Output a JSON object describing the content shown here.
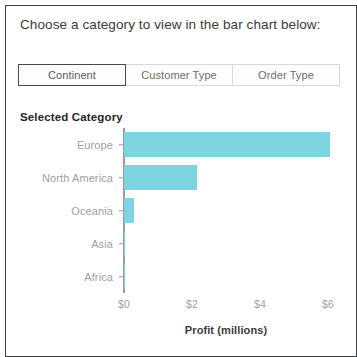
{
  "card": {
    "header_text": "Choose a category to view in the bar chart below:"
  },
  "slicer": {
    "name": "category-slicer",
    "selected": "Continent",
    "options": [
      {
        "label": "Continent",
        "selected": true
      },
      {
        "label": "Customer Type",
        "selected": false
      },
      {
        "label": "Order Type",
        "selected": false
      }
    ]
  },
  "colors": {
    "bar": "#7ED4E0",
    "axis": "#9A9A9A",
    "tick_label": "#A0A0A0",
    "title_text": "#262626",
    "card_border": "#3A3F44",
    "tab_border_selected": "#4A4A4A",
    "tab_border": "#D8D8D8"
  },
  "chart_data": {
    "type": "bar",
    "orientation": "horizontal",
    "title": "Selected Category",
    "categories": [
      "Europe",
      "North America",
      "Oceania",
      "Asia",
      "Africa"
    ],
    "values": [
      6.05,
      2.15,
      0.3,
      0.04,
      0.03
    ],
    "xlabel": "Profit (millions)",
    "ylabel": "",
    "xlim": [
      0,
      6.05
    ],
    "xticks": [
      0,
      2,
      4,
      6
    ],
    "xtick_labels": [
      "$0",
      "$2",
      "$4",
      "$6"
    ],
    "grid": false,
    "legend": false,
    "series": [
      {
        "name": "Profit (millions)",
        "values": [
          6.05,
          2.15,
          0.3,
          0.04,
          0.03
        ]
      }
    ]
  }
}
